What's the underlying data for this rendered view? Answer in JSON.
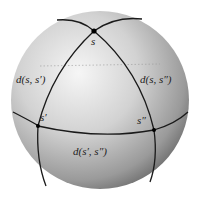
{
  "diagram": {
    "type": "spherical-triangle",
    "points": [
      {
        "id": "s",
        "label": "s"
      },
      {
        "id": "s1",
        "label": "s′"
      },
      {
        "id": "s2",
        "label": "s″"
      }
    ],
    "edge_labels": {
      "s_s1": "d(s, s′)",
      "s_s2": "d(s, s″)",
      "s1_s2": "d(s′, s″)"
    },
    "colors": {
      "sphere_light": "#f4f4f4",
      "sphere_dark": "#6a6a6a",
      "line": "#1a1a1a"
    }
  }
}
